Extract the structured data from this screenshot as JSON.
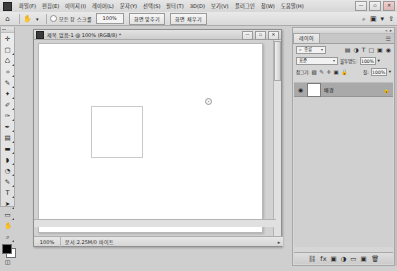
{
  "app": {
    "logo_icon": "app-logo-icon",
    "menu": [
      {
        "label": "파일(F)"
      },
      {
        "label": "편집(E)"
      },
      {
        "label": "이미지(I)"
      },
      {
        "label": "레이어(L)"
      },
      {
        "label": "문자(Y)"
      },
      {
        "label": "선택(S)"
      },
      {
        "label": "필터(T)"
      },
      {
        "label": "3D(D)"
      },
      {
        "label": "보기(V)"
      },
      {
        "label": "플러그인"
      },
      {
        "label": "창(W)"
      },
      {
        "label": "도움말(H)"
      }
    ],
    "window_buttons": [
      {
        "name": "minimize",
        "glyph": "—"
      },
      {
        "name": "maximize",
        "glyph": "▫"
      },
      {
        "name": "close",
        "glyph": "✕"
      }
    ]
  },
  "options_bar": {
    "home_icon": "home-icon",
    "tool_icon": "move-tool-icon",
    "tool_arrow": "▾",
    "auto_select_label": "모든 창 스크롤",
    "zoom_value": "100%",
    "buttons": [
      {
        "label": "화면 맞추기"
      },
      {
        "label": "화면 채우기"
      }
    ],
    "right_icons": [
      {
        "name": "search-icon",
        "glyph": "⌕"
      },
      {
        "name": "workspace-icon",
        "glyph": "▣"
      },
      {
        "name": "workspace-arrow",
        "glyph": "▾"
      },
      {
        "name": "share-icon",
        "glyph": "⇪"
      }
    ]
  },
  "toolbox": {
    "tools": [
      {
        "name": "move-tool",
        "glyph": "✛",
        "selected": false
      },
      {
        "name": "marquee-tool",
        "glyph": "▢",
        "selected": false
      },
      {
        "name": "lasso-tool",
        "glyph": "♺",
        "selected": false
      },
      {
        "name": "crop-tool",
        "glyph": "⌗",
        "selected": false
      },
      {
        "name": "eyedropper-tool",
        "glyph": "✎",
        "selected": false
      },
      {
        "name": "healing-brush-tool",
        "glyph": "✦",
        "selected": false
      },
      {
        "name": "brush-tool",
        "glyph": "✐",
        "selected": false
      },
      {
        "name": "clone-stamp-tool",
        "glyph": "✑",
        "selected": false
      },
      {
        "name": "history-brush-tool",
        "glyph": "✒",
        "selected": false
      },
      {
        "name": "eraser-tool",
        "glyph": "▤",
        "selected": false
      },
      {
        "name": "gradient-tool",
        "glyph": "▬",
        "selected": false
      },
      {
        "name": "blur-tool",
        "glyph": "◗",
        "selected": false
      },
      {
        "name": "dodge-tool",
        "glyph": "◔",
        "selected": false
      },
      {
        "name": "pen-tool",
        "glyph": "✎",
        "selected": false
      },
      {
        "name": "type-tool",
        "glyph": "T",
        "selected": false
      },
      {
        "name": "path-selection-tool",
        "glyph": "➤",
        "selected": false
      },
      {
        "name": "shape-tool",
        "glyph": "▭",
        "selected": false
      },
      {
        "name": "hand-tool",
        "glyph": "✋",
        "selected": false
      },
      {
        "name": "zoom-tool",
        "glyph": "⌕",
        "selected": false
      }
    ],
    "foreground_color": "#000000",
    "background_color": "#ffffff",
    "quickmask_icon": "quick-mask-icon",
    "quickmask_glyph": "◫"
  },
  "document": {
    "title": "제목 없음-1 @ 100% (RGB/8) *",
    "icon": "document-icon",
    "window_buttons": [
      {
        "name": "doc-minimize",
        "glyph": "—"
      },
      {
        "name": "doc-maximize",
        "glyph": "▫"
      },
      {
        "name": "doc-close",
        "glyph": "✕"
      }
    ],
    "status": {
      "zoom": "100%",
      "info": "문서:2.25M/0 바이트",
      "arrow": "▸"
    }
  },
  "panel": {
    "tab_label": "레이어",
    "menu_glyph": "☰",
    "grip_glyphs": [
      "«",
      "▸"
    ],
    "filter": {
      "kind_icon": "filter-kind-icon",
      "kind_label": "종류",
      "arrow": "▾",
      "type_icons": [
        {
          "name": "filter-pixel-icon",
          "glyph": "▤"
        },
        {
          "name": "filter-adjustment-icon",
          "glyph": "◑"
        },
        {
          "name": "filter-type-icon",
          "glyph": "T"
        },
        {
          "name": "filter-shape-icon",
          "glyph": "▢"
        },
        {
          "name": "filter-smart-icon",
          "glyph": "▣"
        },
        {
          "name": "filter-toggle-icon",
          "glyph": "◉"
        }
      ]
    },
    "blend": {
      "mode": "표준",
      "arrow": "▾",
      "opacity_label": "불투명도:",
      "opacity_value": "100%",
      "opacity_arrow": "▾"
    },
    "lock": {
      "label": "잠그기:",
      "icons": [
        {
          "name": "lock-transparent-icon",
          "glyph": "▨"
        },
        {
          "name": "lock-image-icon",
          "glyph": "✎"
        },
        {
          "name": "lock-position-icon",
          "glyph": "✛"
        },
        {
          "name": "lock-nesting-icon",
          "glyph": "▣"
        },
        {
          "name": "lock-all-icon",
          "glyph": "🔒"
        },
        {
          "name": "lock-artboard-icon",
          "glyph": "▦"
        }
      ],
      "fill_label": "칠:",
      "fill_value": "100%",
      "fill_arrow": "▾"
    },
    "layers": [
      {
        "name": "배경",
        "visible": true,
        "visibility_icon": "eye-icon",
        "visibility_glyph": "◉",
        "thumbnail_color": "#ffffff",
        "locked": true,
        "lock_glyph": "🔒",
        "selected": true
      }
    ],
    "footer_buttons": [
      {
        "name": "link-layers-button",
        "glyph": "⛓"
      },
      {
        "name": "layer-style-button",
        "glyph": "fx"
      },
      {
        "name": "layer-mask-button",
        "glyph": "▣"
      },
      {
        "name": "adjustment-layer-button",
        "glyph": "◑"
      },
      {
        "name": "new-group-button",
        "glyph": "▭"
      },
      {
        "name": "new-layer-button",
        "glyph": "▣"
      },
      {
        "name": "delete-layer-button",
        "glyph": "🗑"
      }
    ]
  },
  "colors": {
    "chrome": "#d6d6d6",
    "canvas_white": "#ffffff",
    "selected_layer": "#a9a9a9",
    "shape_border": "#c9c9c9"
  }
}
